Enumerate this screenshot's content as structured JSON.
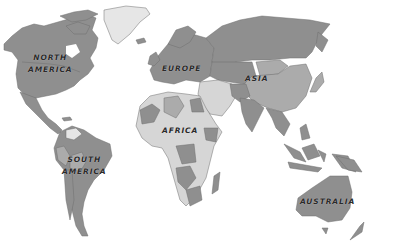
{
  "colors": {
    "dark": "#8f8f8f",
    "mid": "#ababab",
    "light": "#d6d6d6",
    "verylight": "#e6e6e6",
    "border": "#6e6e6e",
    "background": "#ffffff"
  },
  "labels": {
    "north_america_1": "NORTH",
    "north_america_2": "AMERICA",
    "europe": "EUROPE",
    "asia": "ASIA",
    "africa": "AFRICA",
    "south_america_1": "SOUTH",
    "south_america_2": "AMERICA",
    "australia": "AUSTRALIA"
  }
}
